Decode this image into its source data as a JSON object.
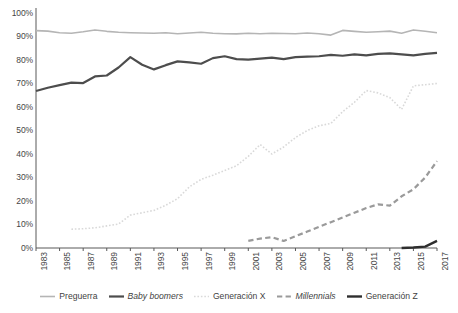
{
  "chart_data": {
    "type": "line",
    "title": "",
    "subtitle": "",
    "xlabel": "",
    "ylabel": "",
    "xlim": [
      1983,
      2017
    ],
    "ylim": [
      0,
      1.0
    ],
    "grid": false,
    "legend_position": "bottom",
    "y_ticks": [
      "0%",
      "10%",
      "20%",
      "30%",
      "40%",
      "50%",
      "60%",
      "70%",
      "80%",
      "90%",
      "100%"
    ],
    "y_tick_values": [
      0,
      10,
      20,
      30,
      40,
      50,
      60,
      70,
      80,
      90,
      100
    ],
    "x_ticks": [
      "1983",
      "1985",
      "1987",
      "1989",
      "1991",
      "1993",
      "1995",
      "1997",
      "1999",
      "2001",
      "2003",
      "2005",
      "2007",
      "2009",
      "2011",
      "2013",
      "2015",
      "2017"
    ],
    "x_tick_values": [
      1983,
      1985,
      1987,
      1989,
      1991,
      1993,
      1995,
      1997,
      1999,
      2001,
      2003,
      2005,
      2007,
      2009,
      2011,
      2013,
      2015,
      2017
    ],
    "x": [
      1983,
      1984,
      1985,
      1986,
      1987,
      1988,
      1989,
      1990,
      1991,
      1992,
      1993,
      1994,
      1995,
      1996,
      1997,
      1998,
      1999,
      2000,
      2001,
      2002,
      2003,
      2004,
      2005,
      2006,
      2007,
      2008,
      2009,
      2010,
      2011,
      2012,
      2013,
      2014,
      2015,
      2016,
      2017
    ],
    "series": [
      {
        "name": "Preguerra",
        "color": "#b5b5b5",
        "style": "solid",
        "width": 1.6,
        "italic": false,
        "x": [
          1983,
          1984,
          1985,
          1986,
          1987,
          1988,
          1989,
          1990,
          1991,
          1992,
          1993,
          1994,
          1995,
          1996,
          1997,
          1998,
          1999,
          2000,
          2001,
          2002,
          2003,
          2004,
          2005,
          2006,
          2007,
          2008,
          2009,
          2010,
          2011,
          2012,
          2013,
          2014,
          2015,
          2016,
          2017
        ],
        "values": [
          92.5,
          92.3,
          91.6,
          91.4,
          92.0,
          92.8,
          92.2,
          91.8,
          91.6,
          91.5,
          91.4,
          91.6,
          91.2,
          91.5,
          91.8,
          91.4,
          91.2,
          91.1,
          91.4,
          91.2,
          91.4,
          91.3,
          91.2,
          91.5,
          91.2,
          90.6,
          92.6,
          92.2,
          91.8,
          92.0,
          92.3,
          91.4,
          92.8,
          92.2,
          91.6
        ]
      },
      {
        "name": "Baby boomers",
        "color": "#4d4d4d",
        "style": "solid",
        "width": 2.2,
        "italic": true,
        "x": [
          1983,
          1984,
          1985,
          1986,
          1987,
          1988,
          1989,
          1990,
          1991,
          1992,
          1993,
          1994,
          1995,
          1996,
          1997,
          1998,
          1999,
          2000,
          2001,
          2002,
          2003,
          2004,
          2005,
          2006,
          2007,
          2008,
          2009,
          2010,
          2011,
          2012,
          2013,
          2014,
          2015,
          2016,
          2017
        ],
        "values": [
          66.8,
          68.2,
          69.3,
          70.4,
          70.2,
          73.0,
          73.4,
          76.8,
          81.2,
          78.0,
          76.0,
          77.8,
          79.4,
          79.0,
          78.4,
          80.8,
          81.6,
          80.4,
          80.2,
          80.6,
          81.0,
          80.4,
          81.2,
          81.4,
          81.6,
          82.2,
          81.8,
          82.4,
          82.0,
          82.6,
          82.8,
          82.4,
          82.0,
          82.6,
          83.0
        ]
      },
      {
        "name": "Generación X",
        "color": "#d9d9d9",
        "style": "dotted",
        "width": 1.6,
        "italic": false,
        "x": [
          1986,
          1987,
          1988,
          1989,
          1990,
          1991,
          1992,
          1993,
          1994,
          1995,
          1996,
          1997,
          1998,
          1999,
          2000,
          2001,
          2002,
          2003,
          2004,
          2005,
          2006,
          2007,
          2008,
          2009,
          2010,
          2011,
          2012,
          2013,
          2014,
          2015,
          2016,
          2017
        ],
        "values": [
          8.0,
          8.2,
          8.6,
          9.4,
          10.2,
          14.0,
          15.0,
          16.0,
          18.2,
          21.0,
          26.0,
          29.2,
          31.0,
          33.0,
          35.0,
          39.0,
          44.0,
          40.0,
          43.0,
          47.0,
          50.0,
          52.0,
          53.0,
          58.0,
          62.0,
          67.0,
          66.0,
          64.0,
          59.0,
          69.0,
          69.5,
          70.0
        ]
      },
      {
        "name": "Millennials",
        "color": "#9a9a9a",
        "style": "dashed",
        "width": 2.2,
        "italic": true,
        "x": [
          2001,
          2002,
          2003,
          2004,
          2005,
          2006,
          2007,
          2008,
          2009,
          2010,
          2011,
          2012,
          2013,
          2014,
          2015,
          2016,
          2017
        ],
        "values": [
          3.0,
          4.0,
          4.6,
          3.0,
          5.0,
          7.0,
          9.0,
          11.0,
          13.0,
          15.0,
          17.0,
          18.6,
          18.0,
          22.0,
          25.0,
          30.0,
          37.0
        ]
      },
      {
        "name": "Generación Z",
        "color": "#2e2e2e",
        "style": "solid",
        "width": 2.4,
        "italic": false,
        "x": [
          2014,
          2015,
          2016,
          2017
        ],
        "values": [
          0.0,
          0.2,
          0.6,
          3.0
        ]
      }
    ]
  },
  "legend": {
    "items": [
      {
        "label": "Preguerra"
      },
      {
        "label": "Baby boomers"
      },
      {
        "label": "Generación X"
      },
      {
        "label": "Millennials"
      },
      {
        "label": "Generación Z"
      }
    ]
  },
  "axes": {
    "axis_color": "#595959"
  }
}
